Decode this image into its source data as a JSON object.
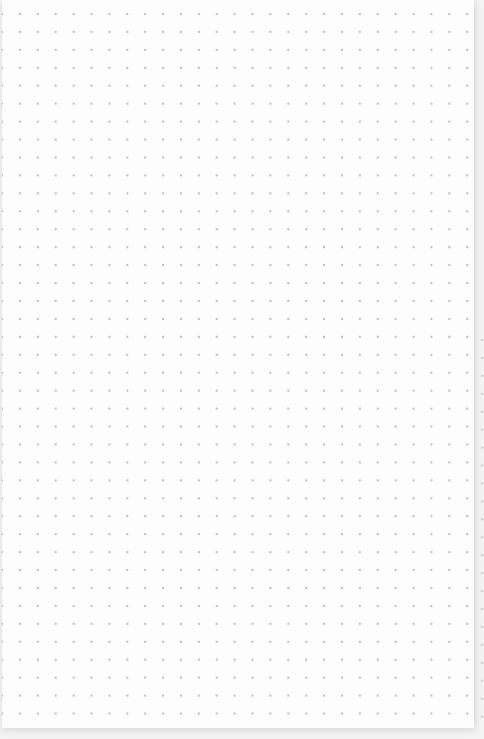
{
  "canvas": {
    "type": "dot-grid",
    "dot_color": "#bdbdbd",
    "background_color": "#fdfdfd",
    "spacing_px": 18,
    "columns": 26,
    "rows": 40
  }
}
